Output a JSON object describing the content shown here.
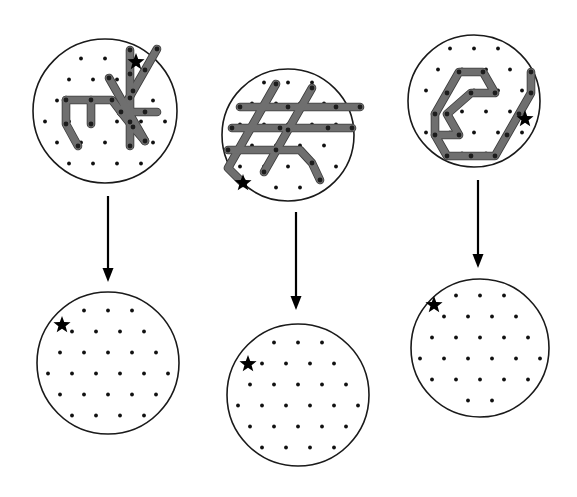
{
  "figure": {
    "description": "Three columns. Top row: circular dot lattices overlaid with thick grey polyline paths. An arrow points down from each top circle to a bottom circle showing the same lattice with the paths cleared. A black star marks one lattice site in every circle.",
    "background_color": "#ffffff",
    "outline_color": "#1a1a1a",
    "dot_color": "#111111",
    "path_fill_color": "#6f6f6f",
    "path_edge_color": "#3d3d3d",
    "star_color": "#000000",
    "arrow_color": "#000000"
  },
  "lattice": {
    "type": "triangular",
    "spacing_x": 24,
    "spacing_y": 21,
    "row_offset_x": 12,
    "dot_radius": 1.9
  },
  "panels": [
    {
      "id": "panel-1",
      "column": 1,
      "row": "top",
      "label": "top-left-circle",
      "center_x": 105,
      "center_y": 111,
      "radius": 72,
      "star": {
        "x": 136,
        "y": 62,
        "size": 9
      },
      "has_paths": true,
      "paths": [
        {
          "id": "p1-a",
          "points": "66,100 88,100 112,100 121,112 133,127 145,141"
        },
        {
          "id": "p1-b",
          "points": "66,100 66,124 78,146"
        },
        {
          "id": "p1-c",
          "points": "91,100 91,124"
        },
        {
          "id": "p1-d",
          "points": "121,112 133,91 145,70 157,49"
        },
        {
          "id": "p1-e",
          "points": "121,112 145,112 157,112"
        },
        {
          "id": "p1-f",
          "points": "130,50 130,74 130,98 130,122 130,146"
        },
        {
          "id": "p1-g",
          "points": "145,141 133,120 121,99 109,78"
        }
      ],
      "path_nodes": [
        [
          66,
          100
        ],
        [
          91,
          100
        ],
        [
          112,
          100
        ],
        [
          121,
          112
        ],
        [
          133,
          127
        ],
        [
          145,
          141
        ],
        [
          66,
          124
        ],
        [
          78,
          146
        ],
        [
          91,
          124
        ],
        [
          133,
          91
        ],
        [
          145,
          70
        ],
        [
          157,
          49
        ],
        [
          145,
          112
        ],
        [
          130,
          50
        ],
        [
          130,
          74
        ],
        [
          130,
          98
        ],
        [
          130,
          122
        ],
        [
          130,
          146
        ],
        [
          109,
          78
        ]
      ]
    },
    {
      "id": "panel-2",
      "column": 2,
      "row": "top",
      "label": "top-middle-circle",
      "center_x": 288,
      "center_y": 135,
      "radius": 66,
      "star": {
        "x": 243,
        "y": 183,
        "size": 9
      },
      "has_paths": true,
      "paths": [
        {
          "id": "p2-a",
          "points": "240,107 264,107 288,107 312,107 336,107 360,107"
        },
        {
          "id": "p2-b",
          "points": "232,128 256,128 280,128 304,128 328,128 352,128"
        },
        {
          "id": "p2-c",
          "points": "276,84 264,105 252,126 240,147 228,168 243,183"
        },
        {
          "id": "p2-d",
          "points": "312,88 300,109 288,130 276,151 264,172"
        },
        {
          "id": "p2-e",
          "points": "228,150 252,150 276,150 300,150 312,163 320,180"
        }
      ],
      "path_nodes": [
        [
          240,
          107
        ],
        [
          288,
          107
        ],
        [
          336,
          107
        ],
        [
          360,
          107
        ],
        [
          232,
          128
        ],
        [
          280,
          128
        ],
        [
          328,
          128
        ],
        [
          352,
          128
        ],
        [
          276,
          84
        ],
        [
          264,
          172
        ],
        [
          312,
          88
        ],
        [
          288,
          130
        ],
        [
          228,
          150
        ],
        [
          276,
          150
        ],
        [
          312,
          163
        ],
        [
          320,
          180
        ],
        [
          243,
          183
        ]
      ]
    },
    {
      "id": "panel-3",
      "column": 3,
      "row": "top",
      "label": "top-right-circle",
      "center_x": 474,
      "center_y": 101,
      "radius": 66,
      "star": {
        "x": 525,
        "y": 119,
        "size": 9
      },
      "has_paths": true,
      "paths": [
        {
          "id": "p3-a",
          "points": "435,114 447,93 459,72 483,72 495,93 471,93 447,114 459,135 435,135 447,156 471,156 495,156 507,135 519,114 531,93 531,72"
        },
        {
          "id": "p3-b",
          "points": "435,114 435,135"
        }
      ],
      "path_nodes": [
        [
          435,
          114
        ],
        [
          447,
          93
        ],
        [
          459,
          72
        ],
        [
          483,
          72
        ],
        [
          495,
          93
        ],
        [
          471,
          93
        ],
        [
          447,
          114
        ],
        [
          459,
          135
        ],
        [
          435,
          135
        ],
        [
          447,
          156
        ],
        [
          471,
          156
        ],
        [
          495,
          156
        ],
        [
          507,
          135
        ],
        [
          519,
          114
        ],
        [
          531,
          93
        ],
        [
          531,
          72
        ]
      ]
    },
    {
      "id": "panel-4",
      "column": 1,
      "row": "bottom",
      "label": "bottom-left-circle",
      "center_x": 108,
      "center_y": 363,
      "radius": 71,
      "star": {
        "x": 62,
        "y": 325,
        "size": 9
      },
      "has_paths": false,
      "paths": [],
      "path_nodes": []
    },
    {
      "id": "panel-5",
      "column": 2,
      "row": "bottom",
      "label": "bottom-middle-circle",
      "center_x": 298,
      "center_y": 395,
      "radius": 71,
      "star": {
        "x": 248,
        "y": 364,
        "size": 9
      },
      "has_paths": false,
      "paths": [],
      "path_nodes": []
    },
    {
      "id": "panel-6",
      "column": 3,
      "row": "bottom",
      "label": "bottom-right-circle",
      "center_x": 480,
      "center_y": 348,
      "radius": 69,
      "star": {
        "x": 434,
        "y": 305,
        "size": 9
      },
      "has_paths": false,
      "paths": [],
      "path_nodes": []
    }
  ],
  "arrows": [
    {
      "id": "arrow-1",
      "label": "arrow-left",
      "x": 108,
      "y_start": 196,
      "y_end": 282,
      "head_width": 11,
      "head_length": 14
    },
    {
      "id": "arrow-2",
      "label": "arrow-middle",
      "x": 296,
      "y_start": 212,
      "y_end": 310,
      "head_width": 11,
      "head_length": 14
    },
    {
      "id": "arrow-3",
      "label": "arrow-right",
      "x": 478,
      "y_start": 180,
      "y_end": 268,
      "head_width": 11,
      "head_length": 14
    }
  ]
}
